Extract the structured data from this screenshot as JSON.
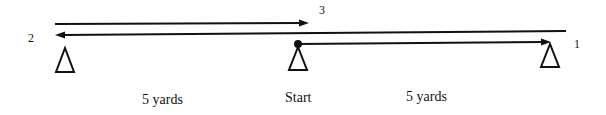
{
  "diagram": {
    "cones": [
      {
        "id": "cone-left",
        "x": 65
      },
      {
        "id": "cone-start",
        "x": 298
      },
      {
        "id": "cone-right",
        "x": 550
      }
    ],
    "markers": {
      "one": "1",
      "two": "2",
      "three": "3"
    },
    "labels": {
      "left_distance": "5 yards",
      "start": "Start",
      "right_distance": "5 yards"
    },
    "paths": [
      {
        "step": "1",
        "from": "Start",
        "to": "right cone",
        "direction": "right"
      },
      {
        "step": "2",
        "from": "right cone",
        "to": "left cone",
        "direction": "left"
      },
      {
        "step": "3",
        "from": "left cone",
        "to": "Start",
        "direction": "right"
      }
    ],
    "color": "#111111"
  }
}
